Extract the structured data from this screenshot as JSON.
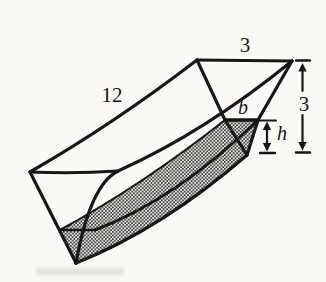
{
  "diagram": {
    "kind": "triangular-trough-with-water",
    "labels": {
      "length": "12",
      "top_width": "3",
      "depth": "3",
      "water_surface_width": "b",
      "water_depth": "h"
    },
    "ink_color": "#171717",
    "paper_color": "#fbfaf7"
  }
}
